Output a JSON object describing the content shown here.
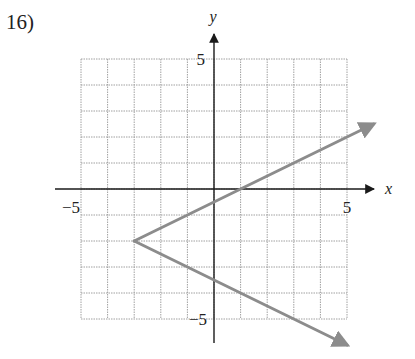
{
  "problem": {
    "number_label": "16)"
  },
  "colors": {
    "grid": "#a0a0a0",
    "axis": "#1a1a1a",
    "curve": "#8c8c8c",
    "text": "#222222"
  },
  "chart_data": {
    "type": "line",
    "title": "",
    "xlabel": "x",
    "ylabel": "y",
    "xlim": [
      -5,
      5
    ],
    "ylim": [
      -5,
      5
    ],
    "grid": true,
    "grid_step": 1,
    "tick_labels": {
      "x": [
        {
          "value": -5,
          "label": "−5"
        },
        {
          "value": 5,
          "label": "5"
        }
      ],
      "y": [
        {
          "value": 5,
          "label": "5"
        },
        {
          "value": -5,
          "label": "−5"
        }
      ]
    },
    "series": [
      {
        "name": "upper branch",
        "description": "ray from vertex (-3,-2) with slope 1/2, arrowhead at end",
        "points": [
          [
            -3,
            -2
          ],
          [
            6,
            2.5
          ]
        ],
        "arrow_end": true
      },
      {
        "name": "lower branch",
        "description": "ray from vertex (-3,-2) with slope -1/2, arrowhead at end",
        "points": [
          [
            -3,
            -2
          ],
          [
            5,
            -6
          ]
        ],
        "arrow_end": true
      }
    ],
    "vertex": [
      -3,
      -2
    ],
    "equation_form": "x = 2|y + 2| - 3"
  }
}
